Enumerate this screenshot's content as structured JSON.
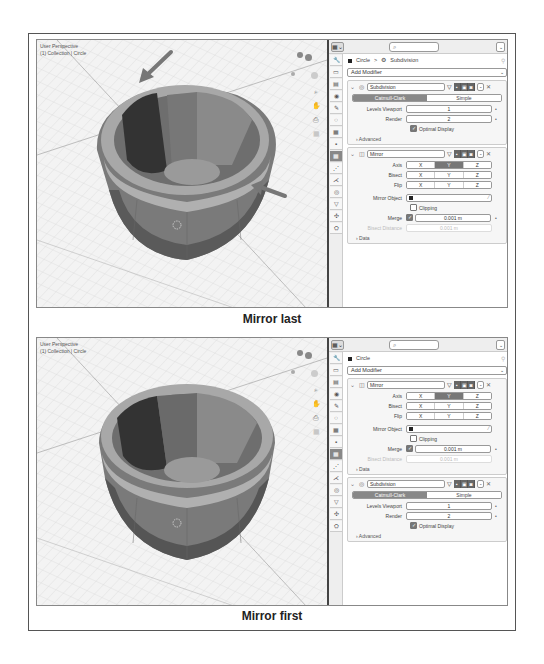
{
  "figures": [
    {
      "caption": "Mirror last",
      "viewport": {
        "view_label": "User Perspective",
        "collection_label": "(1) Collection | Circle",
        "annotations": [
          "arrow-top-left-rim",
          "arrow-right-rim"
        ]
      },
      "properties": {
        "search_placeholder": "",
        "breadcrumb": {
          "object": "Circle",
          "separator": ">",
          "modifier": "Subdivision"
        },
        "add_modifier_label": "Add Modifier",
        "modifiers": [
          {
            "type": "subdivision",
            "name": "Subdivision",
            "mode_options": [
              "Catmull-Clark",
              "Simple"
            ],
            "mode_selected": "Catmull-Clark",
            "fields": [
              {
                "label": "Levels Viewport",
                "value": "1"
              },
              {
                "label": "Render",
                "value": "2"
              }
            ],
            "checkbox": {
              "label": "Optimal Display",
              "checked": true
            },
            "subsection": "Advanced"
          },
          {
            "type": "mirror",
            "name": "Mirror",
            "axis_rows": [
              {
                "label": "Axis",
                "options": [
                  "X",
                  "Y",
                  "Z"
                ],
                "active": "Y"
              },
              {
                "label": "Bisect",
                "options": [
                  "X",
                  "Y",
                  "Z"
                ],
                "active": ""
              },
              {
                "label": "Flip",
                "options": [
                  "X",
                  "Y",
                  "Z"
                ],
                "active": ""
              }
            ],
            "mirror_object_label": "Mirror Object",
            "clipping_label": "Clipping",
            "clipping_checked": false,
            "merge_label": "Merge",
            "merge_checked": true,
            "merge_value": "0.001 m",
            "bisect_distance_label": "Bisect Distance",
            "bisect_distance_value": "0.001 m",
            "subsection": "Data"
          }
        ]
      }
    },
    {
      "caption": "Mirror first",
      "viewport": {
        "view_label": "User Perspective",
        "collection_label": "(1) Collection | Circle",
        "annotations": []
      },
      "properties": {
        "search_placeholder": "",
        "breadcrumb": {
          "object": "Circle"
        },
        "add_modifier_label": "Add Modifier",
        "modifiers": [
          {
            "type": "mirror",
            "name": "Mirror",
            "axis_rows": [
              {
                "label": "Axis",
                "options": [
                  "X",
                  "Y",
                  "Z"
                ],
                "active": "Y"
              },
              {
                "label": "Bisect",
                "options": [
                  "X",
                  "Y",
                  "Z"
                ],
                "active": ""
              },
              {
                "label": "Flip",
                "options": [
                  "X",
                  "Y",
                  "Z"
                ],
                "active": ""
              }
            ],
            "mirror_object_label": "Mirror Object",
            "clipping_label": "Clipping",
            "clipping_checked": false,
            "merge_label": "Merge",
            "merge_checked": true,
            "merge_value": "0.001 m",
            "bisect_distance_label": "Bisect Distance",
            "bisect_distance_value": "0.001 m",
            "subsection": "Data"
          },
          {
            "type": "subdivision",
            "name": "Subdivision",
            "mode_options": [
              "Catmull-Clark",
              "Simple"
            ],
            "mode_selected": "Catmull-Clark",
            "fields": [
              {
                "label": "Levels Viewport",
                "value": "1"
              },
              {
                "label": "Render",
                "value": "2"
              }
            ],
            "checkbox": {
              "label": "Optimal Display",
              "checked": true
            },
            "subsection": "Advanced"
          }
        ]
      }
    }
  ],
  "icons": {
    "search": "⌕",
    "pin": "⚲",
    "collapse": "⌄",
    "expand": "›",
    "close": "✕",
    "filter": "▽",
    "eyedropper": "⁄",
    "dot": "•",
    "check": "✓",
    "chevron": "⌄",
    "tabs": [
      "🔧",
      "▭",
      "▤",
      "◉",
      "✎",
      "◌",
      "▦",
      "▪",
      "▦",
      "⋰",
      "⋌",
      "◎",
      "▽",
      "✣",
      "⛭"
    ]
  }
}
